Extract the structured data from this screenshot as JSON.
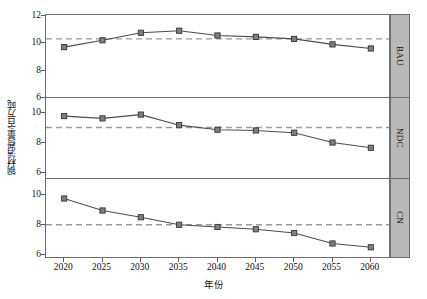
{
  "chart_data": {
    "type": "line",
    "title": "",
    "xlabel": "年份",
    "ylabel": "钢材消费量/百万吨",
    "x": [
      2020,
      2025,
      2030,
      2035,
      2040,
      2045,
      2050,
      2055,
      2060
    ],
    "xticklabels": [
      "2020",
      "2025",
      "2030",
      "2035",
      "2040",
      "2045",
      "2050",
      "2055",
      "2060"
    ],
    "xlim": [
      2017.5,
      2062.5
    ],
    "grid": false,
    "legend": null,
    "marker": "square",
    "series_color": "#808080",
    "line_color": "#4d4d4d",
    "reference_line_style": "dashed",
    "reference_line_color": "#9a9a9a",
    "panels": [
      {
        "strip_label": "BAU",
        "name": "bau-panel",
        "values": [
          9.65,
          10.15,
          10.7,
          10.85,
          10.5,
          10.4,
          10.25,
          9.85,
          9.55
        ],
        "reference_value": 10.25,
        "ylim": [
          6,
          12
        ],
        "yticks": [
          6,
          8,
          10,
          12
        ],
        "yticklabels": [
          "6",
          "8",
          "10",
          "12"
        ]
      },
      {
        "strip_label": "NDC",
        "name": "ndc-panel",
        "values": [
          9.7,
          9.55,
          9.8,
          9.1,
          8.8,
          8.75,
          8.6,
          7.95,
          7.6
        ],
        "reference_value": 8.95,
        "ylim": [
          5.6,
          10.9
        ],
        "yticks": [
          6,
          8,
          10
        ],
        "yticklabels": [
          "6",
          "8",
          "10"
        ]
      },
      {
        "strip_label": "CN",
        "name": "cn-panel",
        "values": [
          9.7,
          8.9,
          8.45,
          7.95,
          7.8,
          7.65,
          7.4,
          6.7,
          6.45
        ],
        "reference_value": 7.95,
        "ylim": [
          5.8,
          11.0
        ],
        "yticks": [
          6,
          8,
          10
        ],
        "yticklabels": [
          "6",
          "8",
          "10"
        ]
      }
    ]
  }
}
